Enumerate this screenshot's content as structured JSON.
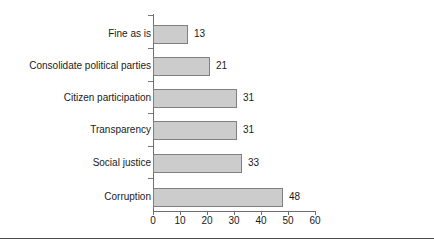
{
  "chart_data": {
    "type": "bar",
    "orientation": "horizontal",
    "title": "",
    "subtitle": "",
    "xlabel": "",
    "ylabel": "",
    "categories": [
      "Fine as is",
      "Consolidate political parties",
      "Citizen participation",
      "Transparency",
      "Social justice",
      "Corruption"
    ],
    "values": [
      13,
      21,
      31,
      31,
      33,
      48
    ],
    "data_labels": [
      "13",
      "21",
      "31",
      "31",
      "33",
      "48"
    ],
    "xlim": [
      0,
      60
    ],
    "xticks": [
      0,
      10,
      20,
      30,
      40,
      50,
      60
    ],
    "xtick_labels": [
      "0",
      "10",
      "20",
      "30",
      "40",
      "50",
      "60"
    ],
    "grid": false,
    "legend": false,
    "legend_position": "none",
    "bar_fill_color": "#cccccc",
    "bar_border_color": "#808080",
    "axis_color": "#6e6e6e",
    "text_color": "#1a1a1a"
  },
  "figure": {
    "caption_sliver": "",
    "background_color": "#ffffff"
  }
}
